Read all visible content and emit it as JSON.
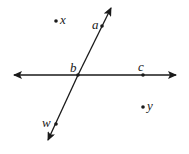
{
  "diagram": {
    "type": "geometry-lines-points",
    "colors": {
      "stroke": "#1a1a1a",
      "background": "#ffffff"
    },
    "lines": [
      {
        "id": "horizontal-line",
        "through": [
          "b",
          "c"
        ],
        "arrows": "both"
      },
      {
        "id": "slanted-line",
        "through": [
          "a",
          "b",
          "w"
        ],
        "arrows": "both"
      }
    ],
    "points": [
      {
        "id": "a",
        "label": "a",
        "on_line": "slanted-line"
      },
      {
        "id": "b",
        "label": "b",
        "on_line": "both (intersection)"
      },
      {
        "id": "c",
        "label": "c",
        "on_line": "horizontal-line"
      },
      {
        "id": "w",
        "label": "w",
        "on_line": "slanted-line"
      },
      {
        "id": "x",
        "label": "x",
        "on_line": "none"
      },
      {
        "id": "y",
        "label": "y",
        "on_line": "none"
      }
    ]
  },
  "labels": {
    "a": "a",
    "b": "b",
    "c": "c",
    "w": "w",
    "x": "x",
    "y": "y"
  }
}
